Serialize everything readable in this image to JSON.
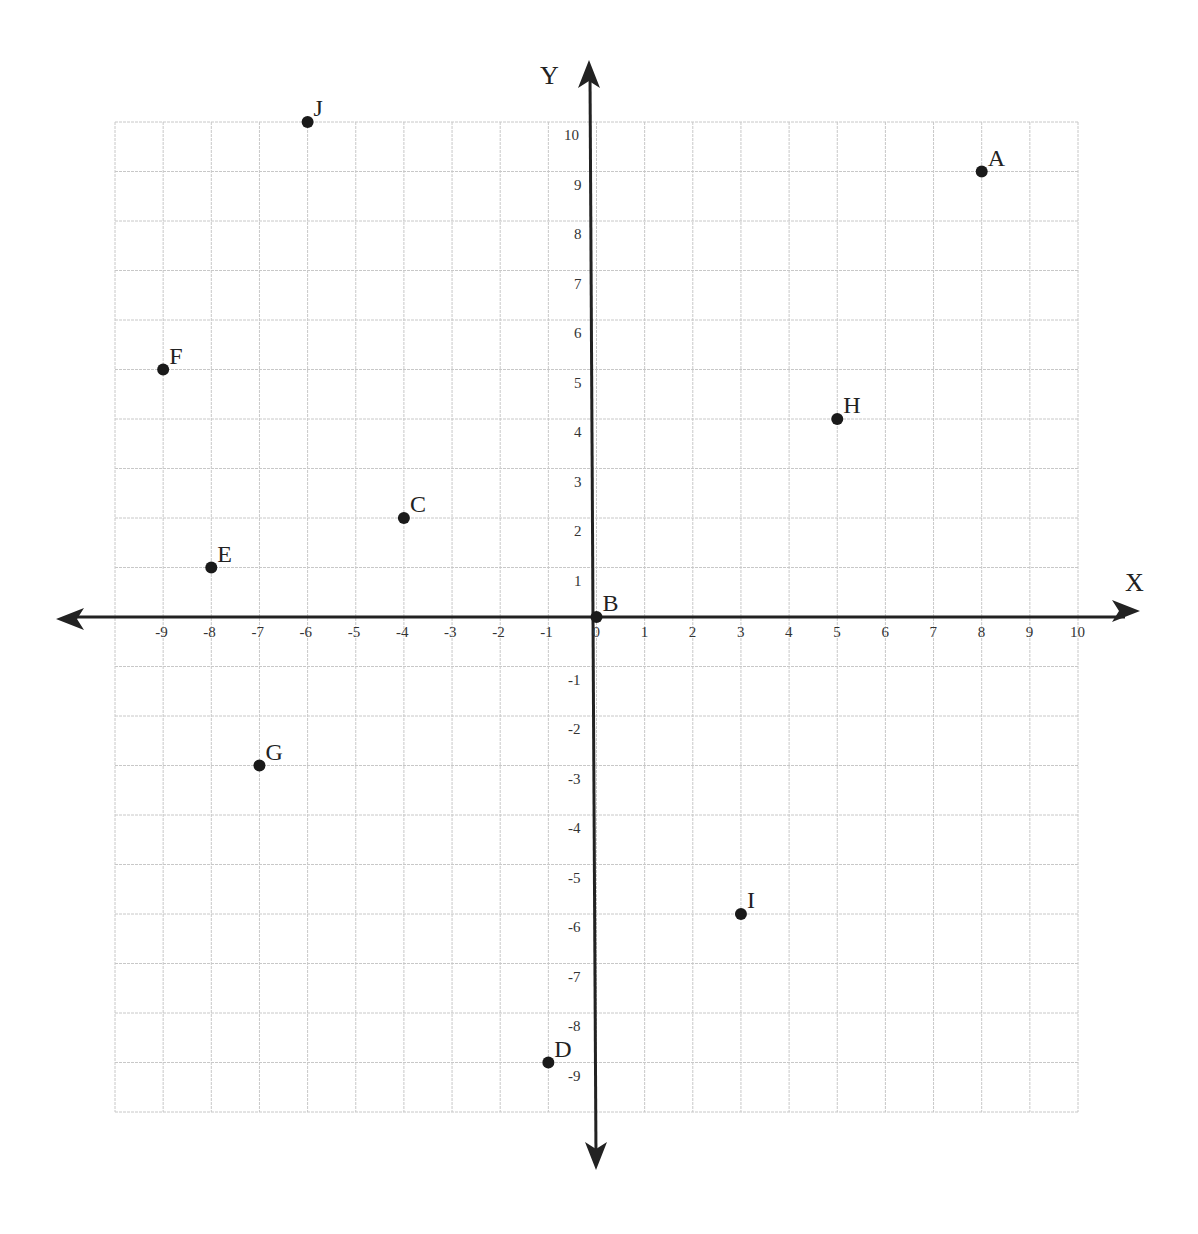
{
  "chart_data": {
    "type": "scatter",
    "title": "",
    "xlabel": "X",
    "ylabel": "Y",
    "xlim": [
      -10,
      10
    ],
    "ylim": [
      -10,
      10
    ],
    "grid": true,
    "x_ticks": [
      -9,
      -8,
      -7,
      -6,
      -5,
      -4,
      -3,
      -2,
      -1,
      0,
      1,
      2,
      3,
      4,
      5,
      6,
      7,
      8,
      9,
      10
    ],
    "y_ticks": [
      10,
      9,
      8,
      7,
      6,
      5,
      4,
      3,
      2,
      1,
      -1,
      -2,
      -3,
      -4,
      -5,
      -6,
      -7,
      -8,
      -9
    ],
    "points": [
      {
        "label": "A",
        "x": 8,
        "y": 9
      },
      {
        "label": "B",
        "x": 0,
        "y": 0
      },
      {
        "label": "C",
        "x": -4,
        "y": 2
      },
      {
        "label": "D",
        "x": -1,
        "y": -9
      },
      {
        "label": "E",
        "x": -8,
        "y": 1
      },
      {
        "label": "F",
        "x": -9,
        "y": 5
      },
      {
        "label": "G",
        "x": -7,
        "y": -3
      },
      {
        "label": "H",
        "x": 5,
        "y": 4
      },
      {
        "label": "I",
        "x": 3,
        "y": -6
      },
      {
        "label": "J",
        "x": -6,
        "y": 10
      }
    ]
  },
  "colors": {
    "grid": "#c8c8c8",
    "axis": "#222222",
    "point": "#1a1a1a"
  }
}
